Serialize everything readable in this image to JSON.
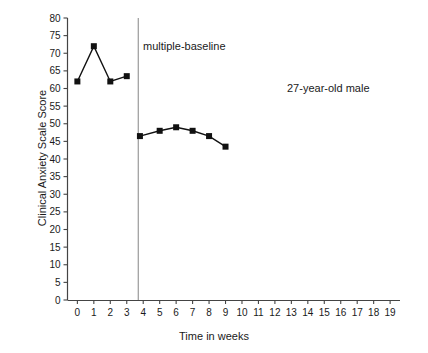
{
  "chart_data": {
    "type": "line",
    "title": "",
    "xlabel": "Time in weeks",
    "ylabel": "Clinical Anxiety Scale Score",
    "xlim": [
      -0.6,
      19.6
    ],
    "ylim": [
      0,
      80
    ],
    "xticks": [
      0,
      1,
      2,
      3,
      4,
      5,
      6,
      7,
      8,
      9,
      10,
      11,
      12,
      13,
      14,
      15,
      16,
      17,
      18,
      19
    ],
    "yticks": [
      0,
      5,
      10,
      15,
      20,
      25,
      30,
      35,
      40,
      45,
      50,
      55,
      60,
      65,
      70,
      75,
      80
    ],
    "grid": false,
    "legend": null,
    "marker": "square",
    "line_color": "#111111",
    "marker_color": "#111111",
    "series": [
      {
        "name": "baseline",
        "x": [
          0,
          1,
          2,
          3
        ],
        "values": [
          62,
          72,
          62,
          63.5
        ]
      },
      {
        "name": "treatment",
        "x": [
          3.8,
          5,
          6,
          7,
          8,
          9
        ],
        "values": [
          46.5,
          48,
          49,
          48,
          46.5,
          43.5
        ]
      }
    ],
    "annotations": [
      {
        "id": "phase-line-label",
        "text": "multiple-baseline",
        "x": 3.9,
        "y": 71
      },
      {
        "id": "subject-label",
        "text": "27-year-old male",
        "x": 12.2,
        "y": 62
      }
    ],
    "phase_line": {
      "x": 3.7,
      "color": "#9a9a9a"
    }
  },
  "axis": {
    "x_tick_labels": [
      "0",
      "1",
      "2",
      "3",
      "4",
      "5",
      "6",
      "7",
      "8",
      "9",
      "10",
      "11",
      "12",
      "13",
      "14",
      "15",
      "16",
      "17",
      "18",
      "19"
    ],
    "y_tick_labels": [
      "0",
      "5",
      "10",
      "15",
      "20",
      "25",
      "30",
      "35",
      "40",
      "45",
      "50",
      "55",
      "60",
      "65",
      "70",
      "75",
      "80"
    ]
  },
  "labels": {
    "y_axis_title": "Clinical Anxiety Scale Score",
    "x_axis_title": "Time in weeks",
    "phase_annotation": "multiple-baseline",
    "subject_annotation": "27-year-old male"
  }
}
